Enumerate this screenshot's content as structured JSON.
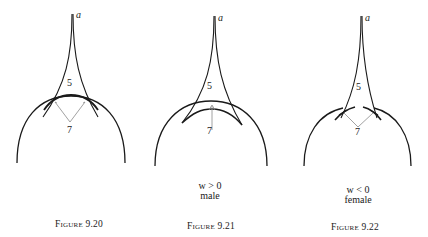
{
  "figures": [
    {
      "id": "9.20",
      "caption_word": "Figure",
      "caption_number": "9.20",
      "cusp_label": "a",
      "region_label_upper": "5",
      "region_label_lower": "7",
      "condition": null,
      "condition_sub": null
    },
    {
      "id": "9.21",
      "caption_word": "Figure",
      "caption_number": "9.21",
      "cusp_label": "a",
      "region_label_upper": "5",
      "region_label_lower": "7",
      "condition": "w > 0",
      "condition_sub": "male"
    },
    {
      "id": "9.22",
      "caption_word": "Figure",
      "caption_number": "9.22",
      "cusp_label": "a",
      "region_label_upper": "5",
      "region_label_lower": "7",
      "condition": "w < 0",
      "condition_sub": "female"
    }
  ],
  "colors": {
    "stroke": "#1a1a1a",
    "thin_stroke": "#8a8a8a",
    "background": "#ffffff"
  }
}
